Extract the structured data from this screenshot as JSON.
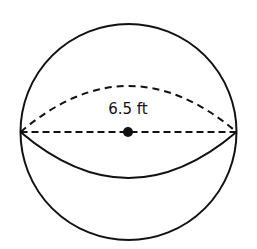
{
  "diagram": {
    "shape": "sphere",
    "label": "6.5 ft",
    "measurement": {
      "value": 6.5,
      "unit": "ft",
      "segment": "radius"
    },
    "colors": {
      "stroke": "#111111",
      "background": "#ffffff"
    }
  }
}
